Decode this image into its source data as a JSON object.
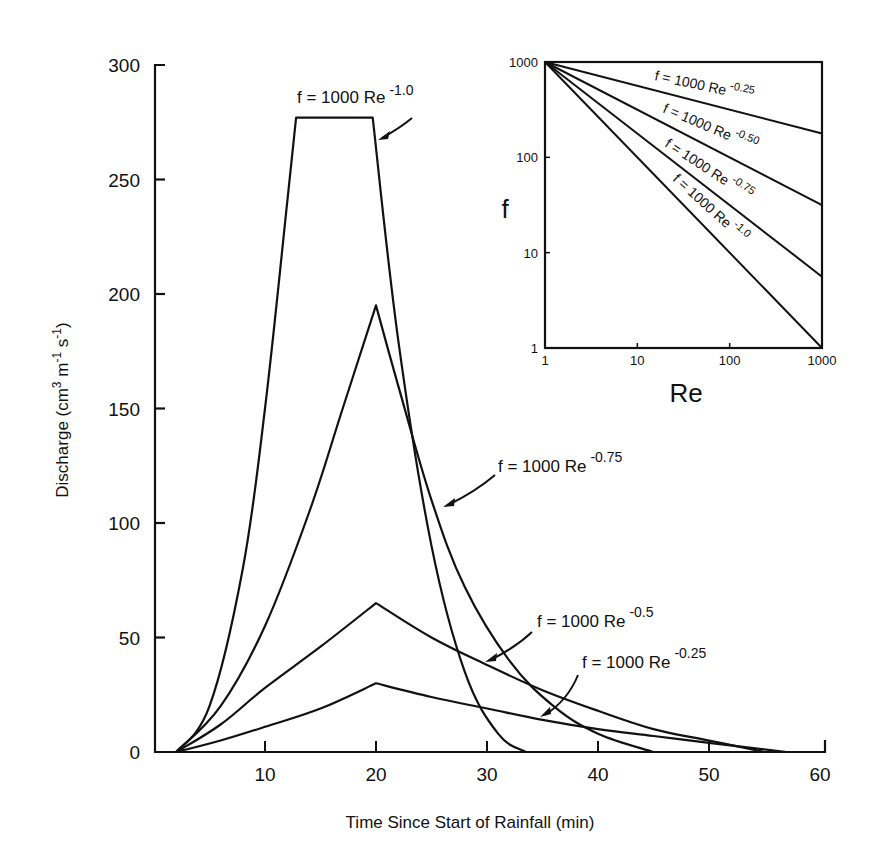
{
  "chart_data": [
    {
      "type": "line",
      "title": "",
      "xlabel": "Time Since Start of Rainfall (min)",
      "ylabel": "Discharge (cm3 m-1 s-1)",
      "ylabel_parts": {
        "base": "Discharge (cm",
        "sup1": "3",
        "mid1": " m",
        "sup2": "-1",
        "mid2": " s",
        "sup3": "-1",
        "end": ")"
      },
      "xlim": [
        0,
        60
      ],
      "ylim": [
        0,
        300
      ],
      "x_ticks": [
        "10",
        "20",
        "30",
        "40",
        "50",
        "60"
      ],
      "y_ticks": [
        "0",
        "50",
        "100",
        "150",
        "200",
        "250",
        "300"
      ],
      "grid": false,
      "series": [
        {
          "name": "f = 1000 Re^-1.0",
          "label_base": "f = 1000 Re",
          "label_exp": "-1.0",
          "x": [
            2,
            5,
            8,
            10,
            12,
            12.8,
            19.7,
            22,
            25,
            28,
            31,
            33.5
          ],
          "y": [
            0,
            20,
            80,
            150,
            240,
            277,
            277,
            180,
            90,
            35,
            8,
            0
          ]
        },
        {
          "name": "f = 1000 Re^-0.75",
          "label_base": "f = 1000 Re",
          "label_exp": "-0.75",
          "x": [
            2,
            6,
            10,
            14,
            17,
            20,
            22,
            25,
            28,
            32,
            36,
            40,
            45
          ],
          "y": [
            0,
            20,
            55,
            105,
            150,
            195,
            160,
            110,
            72,
            40,
            20,
            8,
            0
          ]
        },
        {
          "name": "f = 1000 Re^-0.5",
          "label_base": "f = 1000 Re",
          "label_exp": "-0.5",
          "x": [
            2,
            6,
            10,
            15,
            20,
            25,
            30,
            35,
            40,
            45,
            50,
            55
          ],
          "y": [
            0,
            12,
            28,
            46,
            65,
            50,
            38,
            27,
            18,
            10,
            5,
            0
          ]
        },
        {
          "name": "f = 1000 Re^-0.25",
          "label_base": "f = 1000 Re",
          "label_exp": "-0.25",
          "x": [
            2,
            6,
            10,
            15,
            20,
            25,
            30,
            35,
            40,
            45,
            50,
            57
          ],
          "y": [
            0,
            5,
            11,
            19,
            30,
            24,
            19,
            14,
            10,
            7,
            4,
            0
          ]
        }
      ]
    },
    {
      "type": "line",
      "title": "inset",
      "xlabel": "Re",
      "ylabel": "f",
      "x_scale": "log",
      "y_scale": "log",
      "xlim": [
        1,
        1000
      ],
      "ylim": [
        1,
        1000
      ],
      "x_ticks": [
        "1",
        "10",
        "100",
        "1000"
      ],
      "y_ticks": [
        "1",
        "10",
        "100",
        "1000"
      ],
      "series": [
        {
          "name": "f = 1000 Re^-0.25",
          "label_base": "f = 1000 Re",
          "label_exp": "-0.25",
          "x": [
            1,
            1000
          ],
          "y": [
            1000,
            177.8
          ]
        },
        {
          "name": "f = 1000 Re^-0.50",
          "label_base": "f = 1000 Re",
          "label_exp": "-0.50",
          "x": [
            1,
            1000
          ],
          "y": [
            1000,
            31.6
          ]
        },
        {
          "name": "f = 1000 Re^-0.75",
          "label_base": "f = 1000 Re",
          "label_exp": "-0.75",
          "x": [
            1,
            1000
          ],
          "y": [
            1000,
            5.6
          ]
        },
        {
          "name": "f = 1000 Re^-1.0",
          "label_base": "f = 1000 Re",
          "label_exp": "-1.0",
          "x": [
            1,
            1000
          ],
          "y": [
            1000,
            1
          ]
        }
      ]
    }
  ]
}
